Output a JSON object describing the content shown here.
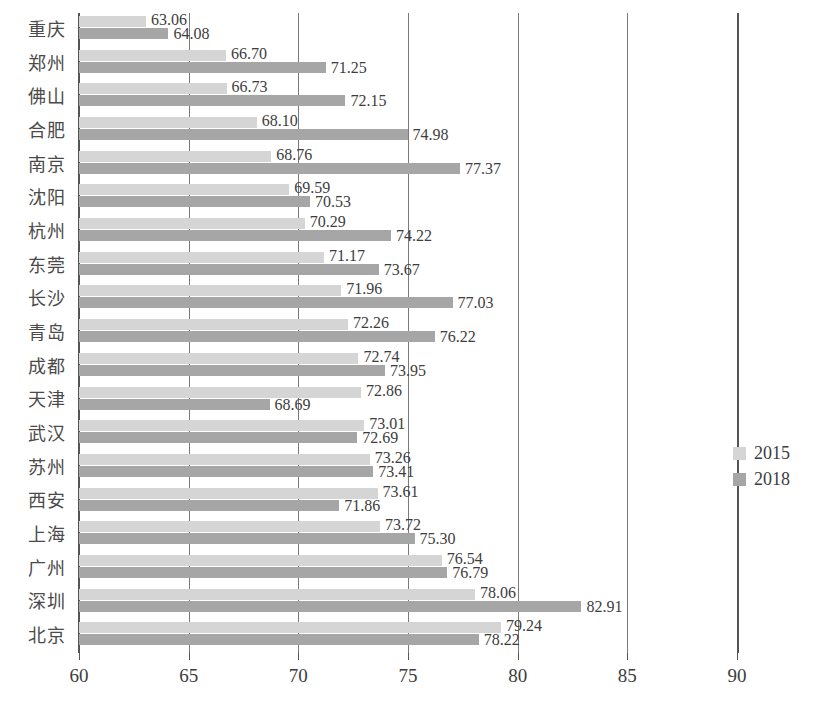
{
  "chart_data": {
    "type": "bar",
    "orientation": "horizontal",
    "title": "",
    "xlabel": "",
    "ylabel": "",
    "xlim": [
      60,
      90
    ],
    "xticks": [
      60,
      65,
      70,
      75,
      80,
      85,
      90
    ],
    "grid": true,
    "legend_position": "right",
    "categories": [
      "重庆",
      "郑州",
      "佛山",
      "合肥",
      "南京",
      "沈阳",
      "杭州",
      "东莞",
      "长沙",
      "青岛",
      "成都",
      "天津",
      "武汉",
      "苏州",
      "西安",
      "上海",
      "广州",
      "深圳",
      "北京"
    ],
    "series": [
      {
        "name": "2015",
        "color": "#d5d5d5",
        "values": [
          63.06,
          66.7,
          66.73,
          68.1,
          68.76,
          69.59,
          70.29,
          71.17,
          71.96,
          72.26,
          72.74,
          72.86,
          73.01,
          73.26,
          73.61,
          73.72,
          76.54,
          78.06,
          79.24
        ]
      },
      {
        "name": "2018",
        "color": "#a6a6a6",
        "values": [
          64.08,
          71.25,
          72.15,
          74.98,
          77.37,
          70.53,
          74.22,
          73.67,
          77.03,
          76.22,
          73.95,
          68.69,
          72.69,
          73.41,
          71.86,
          75.3,
          76.79,
          82.91,
          78.22
        ]
      }
    ],
    "labels": {
      "2015": [
        "63.06",
        "66.70",
        "66.73",
        "68.10",
        "68.76",
        "69.59",
        "70.29",
        "71.17",
        "71.96",
        "72.26",
        "72.74",
        "72.86",
        "73.01",
        "73.26",
        "73.61",
        "73.72",
        "76.54",
        "78.06",
        "79.24"
      ],
      "2018": [
        "64.08",
        "71.25",
        "72.15",
        "74.98",
        "77.37",
        "70.53",
        "74.22",
        "73.67",
        "77.03",
        "76.22",
        "73.95",
        "68.69",
        "72.69",
        "73.41",
        "71.86",
        "75.30",
        "76.79",
        "82.91",
        "78.22"
      ]
    },
    "tick_labels": [
      "60",
      "65",
      "70",
      "75",
      "80",
      "85",
      "90"
    ]
  },
  "legend": {
    "items": [
      {
        "label": "2015",
        "color": "#d5d5d5"
      },
      {
        "label": "2018",
        "color": "#a6a6a6"
      }
    ]
  },
  "colors": {
    "series_2015": "#d5d5d5",
    "series_2018": "#a6a6a6",
    "axis": "#555555",
    "grid": "#7a7a7a",
    "text": "#3d3d3d",
    "background": "#ffffff"
  }
}
